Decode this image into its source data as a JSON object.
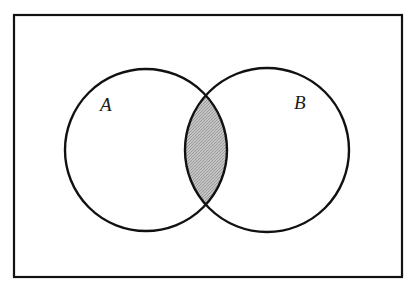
{
  "diagram": {
    "type": "venn",
    "universe": {
      "x": 14,
      "y": 15,
      "width": 388,
      "height": 262,
      "stroke": "#111111",
      "stroke_width": 2.2
    },
    "sets": [
      {
        "id": "A",
        "label": "A",
        "cx": 146,
        "cy": 150,
        "r": 81,
        "label_x": 100,
        "label_y": 111
      },
      {
        "id": "B",
        "label": "B",
        "cx": 267,
        "cy": 150,
        "r": 82,
        "label_x": 294,
        "label_y": 109
      }
    ],
    "shaded_region": "A ∩ B",
    "colors": {
      "background": "#ffffff",
      "outline": "#111111",
      "shade": "#c4c4c4",
      "shade_dot": "#9a9a9a"
    }
  }
}
